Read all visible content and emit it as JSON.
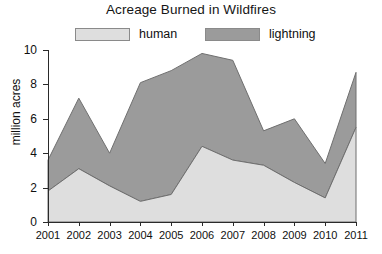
{
  "chart_data": {
    "type": "area",
    "stacked": true,
    "title": "Acreage Burned in Wildfires",
    "xlabel": "",
    "ylabel": "million acres",
    "categories": [
      "2001",
      "2002",
      "2003",
      "2004",
      "2005",
      "2006",
      "2007",
      "2008",
      "2009",
      "2010",
      "2011"
    ],
    "series": [
      {
        "name": "human",
        "color": "#dedede",
        "values": [
          1.8,
          3.1,
          2.1,
          1.2,
          1.6,
          4.4,
          3.6,
          3.3,
          2.3,
          1.4,
          5.5
        ]
      },
      {
        "name": "lightning",
        "color": "#9b9b9b",
        "values": [
          1.8,
          4.1,
          1.9,
          6.9,
          7.2,
          5.4,
          5.8,
          2.0,
          3.7,
          2.0,
          3.2
        ]
      }
    ],
    "totals": [
      3.6,
      7.2,
      4.0,
      8.1,
      8.8,
      9.8,
      9.4,
      5.3,
      6.0,
      3.4,
      8.7
    ],
    "ylim": [
      0,
      10
    ],
    "yticks": [
      0,
      2,
      4,
      6,
      8,
      10
    ],
    "ytick_labels": [
      "0",
      "2",
      "4",
      "6",
      "8",
      "10"
    ],
    "xtick_labels": [
      "2001",
      "2002",
      "2003",
      "2004",
      "2005",
      "2006",
      "2007",
      "2008",
      "2009",
      "2010",
      "2011"
    ],
    "grid": false,
    "legend_position": "top",
    "legend_entries": [
      "human",
      "lightning"
    ]
  },
  "legend": {
    "human_label": "human",
    "lightning_label": "lightning"
  }
}
